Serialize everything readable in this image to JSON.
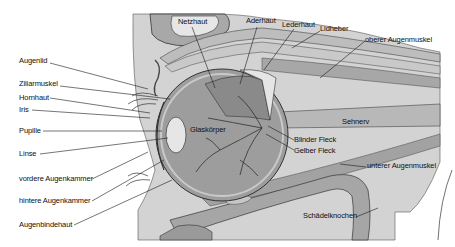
{
  "diagram": {
    "labels_left": [
      {
        "id": "augenlid",
        "text": "Augenlid",
        "x": 19,
        "y": 60
      },
      {
        "id": "ziliarmuskel",
        "text": "Ziliarmuskel",
        "x": 19,
        "y": 83
      },
      {
        "id": "hornhaut",
        "text": "Hornhaut",
        "x": 19,
        "y": 95
      },
      {
        "id": "iris",
        "text": "Iris",
        "x": 19,
        "y": 107
      },
      {
        "id": "pupille",
        "text": "Pupille",
        "x": 19,
        "y": 128
      },
      {
        "id": "linse",
        "text": "Linse",
        "x": 19,
        "y": 151
      },
      {
        "id": "vordere-augenkammer",
        "text": "vordere Augenkammer",
        "x": 19,
        "y": 176
      },
      {
        "id": "hintere-augenkammer",
        "text": "hintere Augenkammer",
        "x": 19,
        "y": 198
      },
      {
        "id": "augenbindehaut",
        "text": "Augenbindehaut",
        "x": 19,
        "y": 222
      }
    ],
    "labels_top": [
      {
        "id": "netzhaut",
        "text": "Netzhaut",
        "x": 178,
        "y": 19
      },
      {
        "id": "aderhaut",
        "text": "Aderhaut",
        "x": 246,
        "y": 19
      },
      {
        "id": "lederhaut",
        "text": "Lederhaut",
        "x": 282,
        "y": 23
      },
      {
        "id": "lidheber",
        "text": "Lidheber",
        "x": 320,
        "y": 27
      },
      {
        "id": "oberer-augenmuskel",
        "text": "oberer Augenmuskel",
        "x": 365,
        "y": 38
      }
    ],
    "labels_inner": [
      {
        "id": "glaskoerper",
        "text": "Glaskörper",
        "x": 190,
        "y": 127
      },
      {
        "id": "sehnerv",
        "text": "Sehnerv",
        "x": 342,
        "y": 120
      },
      {
        "id": "blinder-fleck",
        "text": "Blinder Fleck",
        "x": 294,
        "y": 137
      },
      {
        "id": "gelber-fleck",
        "text": "Gelber Fleck",
        "x": 294,
        "y": 148
      },
      {
        "id": "unterer-augenmuskel",
        "text": "unterer Augenmuskel",
        "x": 367,
        "y": 163
      },
      {
        "id": "schaedelknochen",
        "text": "Schädelknochen",
        "x": 303,
        "y": 213
      }
    ],
    "colors": {
      "background": "#ffffff",
      "tissue_light": "#d6d6d6",
      "tissue_mid": "#b4b4b4",
      "tissue_dark": "#8a8a8a",
      "bone": "#a6a6a6",
      "eyeball": "#9c9c9c",
      "line": "#1a1a1a"
    }
  }
}
